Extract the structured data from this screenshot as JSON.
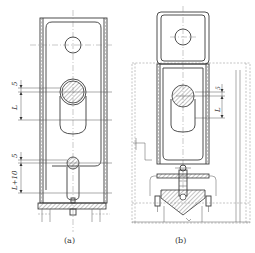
{
  "figure": {
    "subfigures": [
      {
        "id": "a",
        "caption": "(a)",
        "dimensions": {
          "upper_gap": "5",
          "upper_length": "L",
          "lower_gap": "5",
          "lower_length": "L+10"
        }
      },
      {
        "id": "b",
        "caption": "(b)",
        "dimensions": {
          "upper_gap": "5",
          "upper_length": "L"
        }
      }
    ]
  },
  "colors": {
    "line": "#3a3a3a",
    "background": "#ffffff"
  }
}
